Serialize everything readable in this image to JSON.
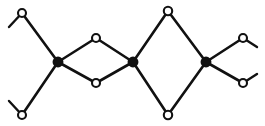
{
  "figure": {
    "width": 265,
    "height": 126,
    "background_color": "#ffffff",
    "line_color": "#111111",
    "open_node_fill": "#ffffff",
    "filled_node_fill": "#111111",
    "line_width": 2.6,
    "node_radius": 4.0
  },
  "chart_data": {
    "type": "scatter",
    "xlabel": "",
    "ylabel": "",
    "xlim": [
      0,
      265
    ],
    "ylim": [
      0,
      126
    ],
    "grid": false,
    "legend": "none",
    "series": [
      {
        "name": "open-nodes",
        "marker": "open-circle",
        "x": [
          22,
          22,
          96,
          96,
          168,
          168,
          243,
          243
        ],
        "y": [
          13,
          115,
          38,
          83,
          11,
          115,
          38,
          83
        ]
      },
      {
        "name": "filled-nodes",
        "marker": "filled-circle",
        "x": [
          58,
          133,
          206
        ],
        "y": [
          62,
          62,
          62
        ]
      }
    ],
    "annotations": [
      "small rhombus spans x 58 to 133",
      "large rhombus spans x 133 to 206",
      "four terminal stub bonds at the outer corners"
    ]
  },
  "nodes": {
    "open": [
      {
        "id": "node-top-left",
        "cx": 22,
        "cy": 13,
        "r": 4.0
      },
      {
        "id": "node-bottom-left",
        "cx": 22,
        "cy": 115,
        "r": 4.0
      },
      {
        "id": "node-small-rhombus-top",
        "cx": 96,
        "cy": 38,
        "r": 4.0
      },
      {
        "id": "node-small-rhombus-bottom",
        "cx": 96,
        "cy": 83,
        "r": 4.0
      },
      {
        "id": "node-large-rhombus-top",
        "cx": 168,
        "cy": 11,
        "r": 4.2
      },
      {
        "id": "node-large-rhombus-bottom",
        "cx": 168,
        "cy": 115,
        "r": 4.2
      },
      {
        "id": "node-top-right",
        "cx": 243,
        "cy": 38,
        "r": 4.0
      },
      {
        "id": "node-bottom-right",
        "cx": 243,
        "cy": 83,
        "r": 4.0
      }
    ],
    "filled": [
      {
        "id": "node-junction-left",
        "cx": 58,
        "cy": 62,
        "r": 4.4
      },
      {
        "id": "node-junction-center",
        "cx": 133,
        "cy": 62,
        "r": 4.4
      },
      {
        "id": "node-junction-right",
        "cx": 206,
        "cy": 62,
        "r": 4.4
      }
    ]
  },
  "edges": [
    {
      "id": "edge-topleft-to-junctionleft",
      "x1": 22,
      "y1": 13,
      "x2": 58,
      "y2": 62
    },
    {
      "id": "edge-bottomleft-to-junctionleft",
      "x1": 22,
      "y1": 115,
      "x2": 58,
      "y2": 62
    },
    {
      "id": "edge-junctionleft-to-smalltop",
      "x1": 58,
      "y1": 62,
      "x2": 96,
      "y2": 38
    },
    {
      "id": "edge-junctionleft-to-smallbottom",
      "x1": 58,
      "y1": 62,
      "x2": 96,
      "y2": 83
    },
    {
      "id": "edge-smalltop-to-junctioncenter",
      "x1": 96,
      "y1": 38,
      "x2": 133,
      "y2": 62
    },
    {
      "id": "edge-smallbottom-to-junctioncenter",
      "x1": 96,
      "y1": 83,
      "x2": 133,
      "y2": 62
    },
    {
      "id": "edge-junctioncenter-to-largetop",
      "x1": 133,
      "y1": 62,
      "x2": 168,
      "y2": 11
    },
    {
      "id": "edge-junctioncenter-to-largebottom",
      "x1": 133,
      "y1": 62,
      "x2": 168,
      "y2": 115
    },
    {
      "id": "edge-largetop-to-junctionright",
      "x1": 168,
      "y1": 11,
      "x2": 206,
      "y2": 62
    },
    {
      "id": "edge-largebottom-to-junctionright",
      "x1": 168,
      "y1": 115,
      "x2": 206,
      "y2": 62
    },
    {
      "id": "edge-junctionright-to-topright",
      "x1": 206,
      "y1": 62,
      "x2": 243,
      "y2": 38
    },
    {
      "id": "edge-junctionright-to-bottomright",
      "x1": 206,
      "y1": 62,
      "x2": 243,
      "y2": 83
    }
  ],
  "stubs": [
    {
      "id": "stub-top-left",
      "x1": 22,
      "y1": 13,
      "x2": 9,
      "y2": 27
    },
    {
      "id": "stub-bottom-left",
      "x1": 22,
      "y1": 115,
      "x2": 9,
      "y2": 101
    },
    {
      "id": "stub-top-right",
      "x1": 243,
      "y1": 38,
      "x2": 257,
      "y2": 47
    },
    {
      "id": "stub-bottom-right",
      "x1": 243,
      "y1": 83,
      "x2": 257,
      "y2": 74
    }
  ]
}
